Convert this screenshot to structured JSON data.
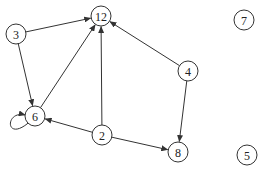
{
  "graph": {
    "type": "directed",
    "node_radius": 10,
    "colors": {
      "stroke": "#333333",
      "fill": "#ffffff",
      "label": "#222222"
    },
    "nodes": [
      {
        "id": "12",
        "label": "12",
        "x": 101,
        "y": 16
      },
      {
        "id": "3",
        "label": "3",
        "x": 16,
        "y": 34
      },
      {
        "id": "7",
        "label": "7",
        "x": 244,
        "y": 20
      },
      {
        "id": "4",
        "label": "4",
        "x": 188,
        "y": 71
      },
      {
        "id": "6",
        "label": "6",
        "x": 35,
        "y": 116
      },
      {
        "id": "2",
        "label": "2",
        "x": 102,
        "y": 135
      },
      {
        "id": "8",
        "label": "8",
        "x": 178,
        "y": 152
      },
      {
        "id": "5",
        "label": "5",
        "x": 247,
        "y": 155
      }
    ],
    "edges": [
      {
        "from": "3",
        "to": "12"
      },
      {
        "from": "3",
        "to": "6"
      },
      {
        "from": "6",
        "to": "12"
      },
      {
        "from": "2",
        "to": "12"
      },
      {
        "from": "4",
        "to": "12"
      },
      {
        "from": "2",
        "to": "6"
      },
      {
        "from": "2",
        "to": "8"
      },
      {
        "from": "4",
        "to": "8"
      },
      {
        "from": "6",
        "to": "6",
        "self_loop": true
      }
    ]
  }
}
